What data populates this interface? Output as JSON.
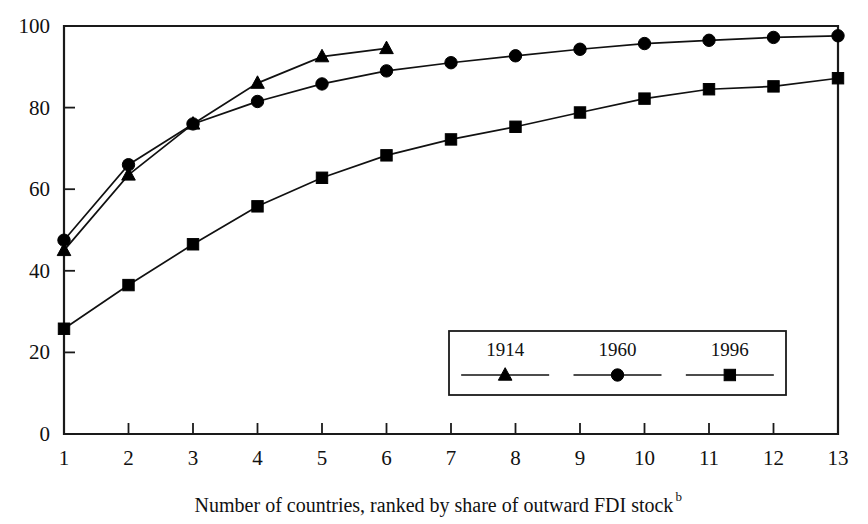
{
  "chart_data": {
    "type": "line",
    "title": "",
    "subtitle": "",
    "xlabel": "Number of countries, ranked by share of outward FDI stock",
    "xlabel_superscript": "b",
    "ylabel": "",
    "x": [
      1,
      2,
      3,
      4,
      5,
      6,
      7,
      8,
      9,
      10,
      11,
      12,
      13
    ],
    "xlim": [
      1,
      13
    ],
    "ylim": [
      0,
      100
    ],
    "xticks": [
      "1",
      "2",
      "3",
      "4",
      "5",
      "6",
      "7",
      "8",
      "9",
      "10",
      "11",
      "12",
      "13"
    ],
    "yticks": [
      "0",
      "20",
      "40",
      "60",
      "80",
      "100"
    ],
    "ytick_values": [
      0,
      20,
      40,
      60,
      80,
      100
    ],
    "grid": false,
    "legend_position": "lower-right-inside",
    "series": [
      {
        "name": "1914",
        "marker": "triangle",
        "color": "#000000",
        "x": [
          1,
          2,
          3,
          4,
          5,
          6
        ],
        "values": [
          45.0,
          63.5,
          76.0,
          86.0,
          92.5,
          94.5
        ]
      },
      {
        "name": "1960",
        "marker": "circle",
        "color": "#000000",
        "x": [
          1,
          2,
          3,
          4,
          5,
          6,
          7,
          8,
          9,
          10,
          11,
          12,
          13
        ],
        "values": [
          47.5,
          66.0,
          76.0,
          81.5,
          85.8,
          89.0,
          91.0,
          92.7,
          94.3,
          95.7,
          96.5,
          97.2,
          97.6
        ]
      },
      {
        "name": "1996",
        "marker": "square",
        "color": "#000000",
        "x": [
          1,
          2,
          3,
          4,
          5,
          6,
          7,
          8,
          9,
          10,
          11,
          12,
          13
        ],
        "values": [
          25.8,
          36.5,
          46.5,
          55.8,
          62.8,
          68.3,
          72.2,
          75.3,
          78.8,
          82.2,
          84.5,
          85.2,
          87.2
        ]
      }
    ]
  },
  "legend": {
    "entries": [
      {
        "label": "1914",
        "marker": "triangle"
      },
      {
        "label": "1960",
        "marker": "circle"
      },
      {
        "label": "1996",
        "marker": "square"
      }
    ]
  },
  "axis": {
    "x_title": "Number of countries, ranked by share of outward FDI stock",
    "x_title_superscript": "b"
  }
}
